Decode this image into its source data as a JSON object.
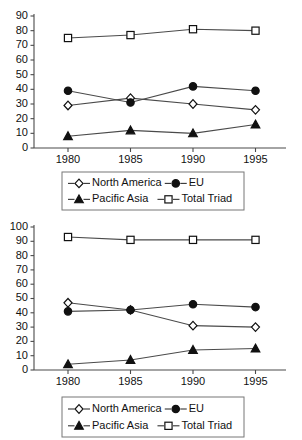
{
  "chart_data": [
    {
      "id": "top",
      "type": "line",
      "title": "",
      "xlabel": "",
      "ylabel": "",
      "x": [
        "1980",
        "1985",
        "1990",
        "1995"
      ],
      "categories": [
        "1980",
        "1985",
        "1990",
        "1995"
      ],
      "ylim": [
        0,
        90
      ],
      "ytick_step": 10,
      "yticks": [
        "0",
        "10",
        "20",
        "30",
        "40",
        "50",
        "60",
        "70",
        "80",
        "90"
      ],
      "grid": false,
      "legend_position": "below",
      "series": [
        {
          "name": "North America",
          "marker": "open-diamond",
          "values": [
            29,
            34,
            30,
            26
          ]
        },
        {
          "name": "EU",
          "marker": "solid-circle",
          "values": [
            39,
            31,
            42,
            39
          ]
        },
        {
          "name": "Pacific Asia",
          "marker": "solid-triangle",
          "values": [
            8,
            12,
            10,
            16
          ]
        },
        {
          "name": "Total Triad",
          "marker": "open-square",
          "values": [
            75,
            77,
            81,
            80
          ]
        }
      ]
    },
    {
      "id": "bottom",
      "type": "line",
      "title": "",
      "xlabel": "",
      "ylabel": "",
      "x": [
        "1980",
        "1985",
        "1990",
        "1995"
      ],
      "categories": [
        "1980",
        "1985",
        "1990",
        "1995"
      ],
      "ylim": [
        0,
        100
      ],
      "ytick_step": 10,
      "yticks": [
        "0",
        "10",
        "20",
        "30",
        "40",
        "50",
        "60",
        "70",
        "80",
        "90",
        "100"
      ],
      "grid": false,
      "legend_position": "below",
      "series": [
        {
          "name": "North America",
          "marker": "open-diamond",
          "values": [
            47,
            42,
            31,
            30
          ]
        },
        {
          "name": "EU",
          "marker": "solid-circle",
          "values": [
            41,
            42,
            46,
            44
          ]
        },
        {
          "name": "Pacific Asia",
          "marker": "solid-triangle",
          "values": [
            4,
            7,
            14,
            15
          ]
        },
        {
          "name": "Total Triad",
          "marker": "open-square",
          "values": [
            93,
            91,
            91,
            91
          ]
        }
      ]
    }
  ],
  "legend": {
    "entries": [
      {
        "label": "North America",
        "marker": "open-diamond"
      },
      {
        "label": "EU",
        "marker": "solid-circle"
      },
      {
        "label": "Pacific Asia",
        "marker": "solid-triangle"
      },
      {
        "label": "Total Triad",
        "marker": "open-square"
      }
    ]
  },
  "colors": {
    "background": "#ffffff",
    "ink": "#111111",
    "axis": "#4a4a4a",
    "legend_border": "#777777",
    "marker_fill_open": "#ffffff",
    "marker_fill_solid": "#111111"
  }
}
